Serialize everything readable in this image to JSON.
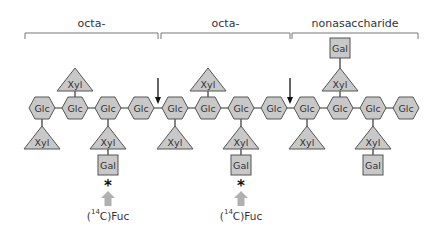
{
  "diagram": {
    "brackets": [
      {
        "label": "octa-",
        "x1": 25,
        "x2": 158
      },
      {
        "label": "octa-",
        "x1": 161,
        "x2": 290
      },
      {
        "label": "nonasaccharide",
        "x1": 292,
        "x2": 418
      }
    ],
    "backbone": {
      "y": 108,
      "residue": "Glc",
      "x": [
        42,
        75,
        108,
        141,
        175,
        208,
        241,
        274,
        307,
        340,
        373,
        406
      ]
    },
    "upper_branches": [
      {
        "at": 75,
        "xyl": "Xyl",
        "gal": null
      },
      {
        "at": 208,
        "xyl": "Xyl",
        "gal": null
      },
      {
        "at": 340,
        "xyl": "Xyl",
        "gal": "Gal"
      }
    ],
    "lower_branches": [
      {
        "at": 42,
        "xyl": "Xyl",
        "gal": null,
        "fucosylated": false
      },
      {
        "at": 108,
        "xyl": "Xyl",
        "gal": "Gal",
        "fucosylated": true
      },
      {
        "at": 175,
        "xyl": "Xyl",
        "gal": null,
        "fucosylated": false
      },
      {
        "at": 241,
        "xyl": "Xyl",
        "gal": "Gal",
        "fucosylated": true
      },
      {
        "at": 307,
        "xyl": "Xyl",
        "gal": null,
        "fucosylated": false
      },
      {
        "at": 373,
        "xyl": "Xyl",
        "gal": "Gal",
        "fucosylated": false
      }
    ],
    "cleavage_arrows_x": [
      158,
      290
    ],
    "fucose": {
      "marker": "*",
      "label_prefix": "(",
      "isotope_mass": "14",
      "label_suffix": "C)Fuc"
    },
    "colors": {
      "shape_fill": "#c8c8c8",
      "shape_stroke": "#555555",
      "line": "#333333",
      "bracket": "#777777",
      "fuc_arrow": "#b0b0b0",
      "text": "#333333"
    }
  }
}
